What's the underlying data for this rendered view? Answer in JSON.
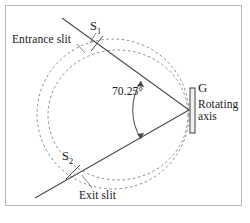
{
  "figure": {
    "kind": "optical-monochromator-schematic",
    "background_color": "#ffffff",
    "border_color": "#b9b9b9",
    "ink_color": "#3f3f3f",
    "text_color": "#1a1a1a",
    "labels": {
      "entrance_slit": "Entrance slit",
      "exit_slit": "Exit slit",
      "s1": "S",
      "s1_sub": "1",
      "s2": "S",
      "s2_sub": "2",
      "angle": "70.25°",
      "grating": "G",
      "rotating_axis_line1": "Rotating",
      "rotating_axis_line2": "axis"
    },
    "geometry": {
      "angle_degrees": 70.25,
      "vertex": {
        "x": 189,
        "y": 110
      },
      "upper_ray_start": {
        "x": 62,
        "y": 18
      },
      "upper_ray_end": {
        "x": 189,
        "y": 110
      },
      "lower_ray_start": {
        "x": 35,
        "y": 198
      },
      "lower_ray_end": {
        "x": 189,
        "y": 110
      },
      "outer_circle": {
        "cx": 113,
        "cy": 114,
        "r": 76
      },
      "inner_circle": {
        "cx": 117,
        "cy": 115,
        "r": 68
      },
      "grating_rect": {
        "x": 190,
        "y": 88,
        "width": 5,
        "height": 45
      },
      "arc_radius": 52,
      "s1_point": {
        "x": 98,
        "y": 44
      },
      "s2_point": {
        "x": 73,
        "y": 172
      }
    }
  }
}
